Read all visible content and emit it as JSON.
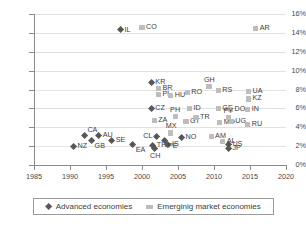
{
  "chart_data": {
    "type": "scatter",
    "title": "",
    "xlabel": "",
    "ylabel": "",
    "xlim": [
      1985,
      2020
    ],
    "ylim": [
      0,
      0.16
    ],
    "xticks": [
      "1985",
      "1990",
      "1995",
      "2000",
      "2005",
      "2010",
      "2015",
      "2020"
    ],
    "yticks": [
      "0%",
      "2%",
      "4%",
      "6%",
      "8%",
      "10%",
      "12%",
      "14%",
      "16%"
    ],
    "grid": "horizontal",
    "legend_position": "bottom",
    "colors": {
      "advanced": "#575757",
      "emerging": "#bdbdbd",
      "grid": "#e2e2e2",
      "axis": "#8a8a8a"
    },
    "series": [
      {
        "name": "Advanced economies",
        "marker": "diamond",
        "points": [
          {
            "label": "IL",
            "x": 1997.0,
            "y": 0.143,
            "pos": "r"
          },
          {
            "label": "KR",
            "x": 2001.3,
            "y": 0.087,
            "pos": "r"
          },
          {
            "label": "CZ",
            "x": 2001.3,
            "y": 0.06,
            "pos": "r"
          },
          {
            "label": "CA",
            "x": 1992.0,
            "y": 0.031,
            "pos": "tr"
          },
          {
            "label": "AU",
            "x": 1994.0,
            "y": 0.031,
            "pos": "r"
          },
          {
            "label": "GB",
            "x": 1993.0,
            "y": 0.026,
            "pos": "br"
          },
          {
            "label": "SE",
            "x": 1995.8,
            "y": 0.026,
            "pos": "r"
          },
          {
            "label": "EA",
            "x": 1998.7,
            "y": 0.022,
            "pos": "br"
          },
          {
            "label": "NZ",
            "x": 1990.5,
            "y": 0.02,
            "pos": "r"
          },
          {
            "label": "CL",
            "x": 2002.0,
            "y": 0.03,
            "pos": "l"
          },
          {
            "label": "NO",
            "x": 2005.5,
            "y": 0.029,
            "pos": "r"
          },
          {
            "label": "TH",
            "x": 2001.5,
            "y": 0.021,
            "pos": "r"
          },
          {
            "label": "IS",
            "x": 2003.6,
            "y": 0.022,
            "pos": "r"
          },
          {
            "label": "CH",
            "x": 2001.8,
            "y": 0.017,
            "pos": "b"
          },
          {
            "label": "PE",
            "x": 2003.2,
            "y": 0.026,
            "pos": "br"
          },
          {
            "label": "US",
            "x": 2012.0,
            "y": 0.022,
            "pos": "r"
          },
          {
            "label": "JP",
            "x": 2012.0,
            "y": 0.017,
            "pos": "r"
          }
        ]
      },
      {
        "name": "Emerginig market economies",
        "marker": "square",
        "points": [
          {
            "label": "CO",
            "x": 2000.0,
            "y": 0.146,
            "pos": "r"
          },
          {
            "label": "AR",
            "x": 2015.8,
            "y": 0.145,
            "pos": "r"
          },
          {
            "label": "BR",
            "x": 2002.3,
            "y": 0.081,
            "pos": "r"
          },
          {
            "label": "PL",
            "x": 2002.3,
            "y": 0.075,
            "pos": "r"
          },
          {
            "label": "HU",
            "x": 2004.0,
            "y": 0.074,
            "pos": "r"
          },
          {
            "label": "RO",
            "x": 2006.3,
            "y": 0.077,
            "pos": "r"
          },
          {
            "label": "GH",
            "x": 2009.3,
            "y": 0.083,
            "pos": "t"
          },
          {
            "label": "RS",
            "x": 2010.6,
            "y": 0.079,
            "pos": "r"
          },
          {
            "label": "UA",
            "x": 2014.8,
            "y": 0.078,
            "pos": "r"
          },
          {
            "label": "KZ",
            "x": 2014.8,
            "y": 0.07,
            "pos": "r"
          },
          {
            "label": "ID",
            "x": 2006.6,
            "y": 0.06,
            "pos": "r"
          },
          {
            "label": "GE",
            "x": 2010.6,
            "y": 0.06,
            "pos": "r"
          },
          {
            "label": "DO",
            "x": 2012.3,
            "y": 0.059,
            "pos": "r"
          },
          {
            "label": "IN",
            "x": 2014.7,
            "y": 0.059,
            "pos": "r"
          },
          {
            "label": "ZA",
            "x": 2001.7,
            "y": 0.047,
            "pos": "r"
          },
          {
            "label": "PH",
            "x": 2004.6,
            "y": 0.051,
            "pos": "t"
          },
          {
            "label": "GT",
            "x": 2006.1,
            "y": 0.046,
            "pos": "r"
          },
          {
            "label": "TR",
            "x": 2007.5,
            "y": 0.05,
            "pos": "r"
          },
          {
            "label": "MD",
            "x": 2010.8,
            "y": 0.045,
            "pos": "r"
          },
          {
            "label": "UG",
            "x": 2012.4,
            "y": 0.046,
            "pos": "r"
          },
          {
            "label": "PY",
            "x": 2012.0,
            "y": 0.05,
            "pos": "t"
          },
          {
            "label": "RU",
            "x": 2014.7,
            "y": 0.043,
            "pos": "r"
          },
          {
            "label": "MX",
            "x": 2004.0,
            "y": 0.034,
            "pos": "t"
          },
          {
            "label": "AM",
            "x": 2009.6,
            "y": 0.03,
            "pos": "r"
          },
          {
            "label": "AL",
            "x": 2011.2,
            "y": 0.025,
            "pos": "r"
          }
        ]
      }
    ]
  },
  "legend": {
    "items": [
      {
        "label": "Advanced economies",
        "marker": "diamond"
      },
      {
        "label": "Emerginig market economies",
        "marker": "square"
      }
    ]
  }
}
